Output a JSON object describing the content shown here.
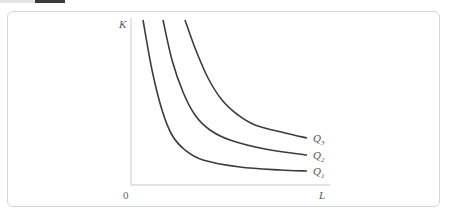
{
  "top_strip": {
    "text": "· · ·"
  },
  "diagram": {
    "y_axis_label": "K",
    "x_axis_label": "L",
    "origin_label": "0",
    "curves": [
      {
        "id": "Q1",
        "label_main": "Q",
        "label_sub": "1",
        "points": [
          [
            143,
            20
          ],
          [
            152,
            70
          ],
          [
            162,
            110
          ],
          [
            172,
            135
          ],
          [
            185,
            150
          ],
          [
            203,
            160
          ],
          [
            240,
            167
          ],
          [
            280,
            170
          ],
          [
            307,
            171
          ]
        ]
      },
      {
        "id": "Q2",
        "label_main": "Q",
        "label_sub": "2",
        "points": [
          [
            163,
            20
          ],
          [
            172,
            60
          ],
          [
            183,
            92
          ],
          [
            195,
            115
          ],
          [
            210,
            130
          ],
          [
            230,
            140
          ],
          [
            265,
            149
          ],
          [
            307,
            155
          ]
        ]
      },
      {
        "id": "Q3",
        "label_main": "Q",
        "label_sub": "3",
        "points": [
          [
            185,
            20
          ],
          [
            195,
            48
          ],
          [
            208,
            78
          ],
          [
            222,
            100
          ],
          [
            238,
            115
          ],
          [
            255,
            125
          ],
          [
            285,
            133
          ],
          [
            307,
            138
          ]
        ]
      }
    ],
    "colors": {
      "curve": "#3c3c3c",
      "axis": "#c8c8c8",
      "border": "#d4d4d4"
    }
  }
}
